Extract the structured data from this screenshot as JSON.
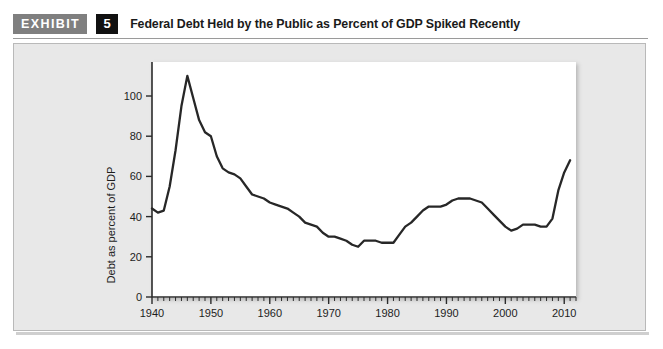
{
  "header": {
    "kicker": "EXHIBIT",
    "number": "5",
    "title": "Federal Debt Held by the Public as Percent of GDP Spiked Recently"
  },
  "colors": {
    "kicker_background": "#7f7f7f",
    "number_background": "#111111",
    "panel_background": "#e8e8e8",
    "plot_background": "#ffffff",
    "series_line": "#272727",
    "axis": "#2b2b2b"
  },
  "chart_data": {
    "type": "line",
    "title": "Federal Debt Held by the Public as Percent of GDP Spiked Recently",
    "xlabel": "",
    "ylabel": "Debt as percent of GDP",
    "xlim": [
      1940,
      2012
    ],
    "ylim": [
      0,
      115
    ],
    "grid": false,
    "legend": "none",
    "x_tick_labels": [
      "1940",
      "1950",
      "1960",
      "1970",
      "1980",
      "1990",
      "2000",
      "2010"
    ],
    "x_major_ticks": [
      1940,
      1950,
      1960,
      1970,
      1980,
      1990,
      2000,
      2010
    ],
    "x_minor_tick_step": 1,
    "y_tick_labels": [
      "0",
      "20",
      "40",
      "60",
      "80",
      "100"
    ],
    "y_major_ticks": [
      0,
      20,
      40,
      60,
      80,
      100
    ],
    "series": [
      {
        "name": "Federal debt held by the public as percent of GDP",
        "x": [
          1940,
          1941,
          1942,
          1943,
          1944,
          1945,
          1946,
          1947,
          1948,
          1949,
          1950,
          1951,
          1952,
          1953,
          1954,
          1955,
          1956,
          1957,
          1958,
          1959,
          1960,
          1961,
          1962,
          1963,
          1964,
          1965,
          1966,
          1967,
          1968,
          1969,
          1970,
          1971,
          1972,
          1973,
          1974,
          1975,
          1976,
          1977,
          1978,
          1979,
          1980,
          1981,
          1982,
          1983,
          1984,
          1985,
          1986,
          1987,
          1988,
          1989,
          1990,
          1991,
          1992,
          1993,
          1994,
          1995,
          1996,
          1997,
          1998,
          1999,
          2000,
          2001,
          2002,
          2003,
          2004,
          2005,
          2006,
          2007,
          2008,
          2009,
          2010,
          2011
        ],
        "values": [
          44,
          42,
          43,
          55,
          73,
          95,
          110,
          99,
          88,
          82,
          80,
          70,
          64,
          62,
          61,
          59,
          55,
          51,
          50,
          49,
          47,
          46,
          45,
          44,
          42,
          40,
          37,
          36,
          35,
          32,
          30,
          30,
          29,
          28,
          26,
          25,
          28,
          28,
          28,
          27,
          27,
          27,
          31,
          35,
          37,
          40,
          43,
          45,
          45,
          45,
          46,
          48,
          49,
          49,
          49,
          48,
          47,
          44,
          41,
          38,
          35,
          33,
          34,
          36,
          36,
          36,
          35,
          35,
          39,
          53,
          62,
          68
        ]
      }
    ]
  }
}
